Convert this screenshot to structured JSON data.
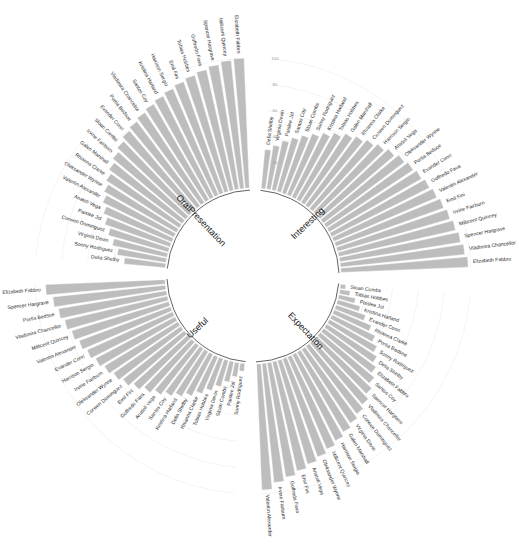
{
  "chart_data": {
    "type": "bar",
    "variant": "circular-barplot",
    "title": "",
    "subtitle": "",
    "xlabel": "",
    "ylabel": "",
    "ylim": [
      0,
      100
    ],
    "yticks": [
      20,
      40,
      60,
      80,
      100
    ],
    "ytick_labels": [
      "20",
      "40",
      "60",
      "80",
      "100"
    ],
    "grid": true,
    "legend": "none",
    "bar_color": "#bdbdbd",
    "bar_edge_color": "#ffffff",
    "baseline_color": "#3a3a3a",
    "label_color": "#2b2b2b",
    "tick_color": "#9a9a9a",
    "groups": [
      {
        "name": "Useful",
        "label": "Useful",
        "start_angle_deg": 185,
        "end_angle_deg": 268,
        "categories": [
          "Sonny Rodriguez",
          "Paislee Jol",
          "Sloan Combs",
          "Virginia Devin",
          "Tobias Hobbes",
          "Rhianna Clarke",
          "Delia Shelby",
          "Kristina Harland",
          "Santos Coy",
          "Anatoli Vega",
          "Goffredo Fava",
          "Emil Fini",
          "Corwen Dominguez",
          "Oleksander Wynne",
          "Irvine Fairburn",
          "Harrison Sergio",
          "Evander Conri",
          "Valentin Alexander",
          "Millicent Quincey",
          "Vladimira Chancellor",
          "Portia Bedsoe",
          "Spencer Hargrave",
          "Elizabeth Fabbro"
        ],
        "values": [
          6,
          11,
          16,
          21,
          26,
          31,
          36,
          40,
          44,
          48,
          52,
          56,
          60,
          63,
          66,
          69,
          72,
          75,
          78,
          81,
          84,
          87,
          92
        ]
      },
      {
        "name": "Expectation",
        "label": "Expectation",
        "start_angle_deg": 95,
        "end_angle_deg": 178,
        "categories": [
          "Sloan Combs",
          "Tobias Hobbes",
          "Paislee Jol",
          "Kristina Harland",
          "Evander Conri",
          "Rhianna Clarke",
          "Portia Bedsoe",
          "Sonny Rodriguez",
          "Delia Shelby",
          "Elizabeth Fabbro",
          "Santos Coy",
          "Spencer Hargrave",
          "Vladimira Chancellor",
          "Corwen Dominguez",
          "Virginia Devin",
          "Galen Marshall",
          "Harrison Sergio",
          "Millicent Quincey",
          "Oleksander Wynne",
          "Anatoli Vega",
          "Emil Fini",
          "Goffredo Fava",
          "Irvine Fairburn",
          "Valentin Alexander"
        ],
        "values": [
          4,
          8,
          13,
          18,
          24,
          31,
          37,
          42,
          46,
          50,
          54,
          58,
          62,
          65,
          68,
          71,
          74,
          77,
          80,
          83,
          86,
          89,
          92,
          97
        ]
      },
      {
        "name": "Interesting",
        "label": "Interesting",
        "start_angle_deg": 5,
        "end_angle_deg": 88,
        "categories": [
          "Delia Shelby",
          "Virginia Devin",
          "Paislee Jol",
          "Santos Coy",
          "Sloan Combs",
          "Sonny Rodriguez",
          "Kristina Harland",
          "Tobias Hobbes",
          "Galen Marshall",
          "Rhianna Clarke",
          "Corwen Dominguez",
          "Harrison Sergio",
          "Anatoli Vega",
          "Oleksander Wynne",
          "Portia Bedsoe",
          "Evander Conri",
          "Goffredo Fava",
          "Valentin Alexander",
          "Emil Fini",
          "Irvine Fairburn",
          "Millicent Quincey",
          "Spencer Hargrave",
          "Vladimira Chancellor",
          "Elizabeth Fabbro"
        ],
        "values": [
          30,
          34,
          39,
          43,
          47,
          51,
          55,
          59,
          63,
          66,
          69,
          72,
          75,
          78,
          80,
          82,
          84,
          86,
          88,
          90,
          92,
          94,
          96,
          98
        ]
      },
      {
        "name": "OralPresentation",
        "label": "OralPresentation",
        "start_angle_deg": 275,
        "end_angle_deg": 358,
        "categories": [
          "Delia Shelby",
          "Sonny Rodriguez",
          "Virginia Devin",
          "Corwen Dominguez",
          "Paislee Jol",
          "Anatoli Vega",
          "Valentin Alexander",
          "Oleksander Wynne",
          "Rhianna Clarke",
          "Galen Marshall",
          "Irvine Fairburn",
          "Sloan Combs",
          "Evander Conri",
          "Portia Bedsoe",
          "Vladimira Chancellor",
          "Santos Coy",
          "Kristina Harland",
          "Harrison Sergio",
          "Emil Fini",
          "Tobias Hobbes",
          "Goffredo Fava",
          "Spencer Hargrave",
          "Millicent Quincey",
          "Elizabeth Fabbro"
        ],
        "values": [
          32,
          38,
          43,
          48,
          53,
          57,
          61,
          64,
          67,
          70,
          73,
          76,
          79,
          81,
          83,
          85,
          87,
          89,
          91,
          93,
          95,
          97,
          99,
          100
        ]
      }
    ]
  }
}
